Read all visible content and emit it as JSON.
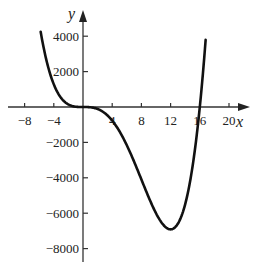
{
  "chart_data": {
    "type": "line",
    "title": "",
    "xlabel": "x",
    "ylabel": "y",
    "xlim": [
      -10,
      22
    ],
    "ylim": [
      -8600,
      4300
    ],
    "x_ticks": [
      -8,
      -4,
      4,
      8,
      12,
      16,
      20
    ],
    "x_tick_labels": [
      "−8",
      "−4",
      "4",
      "8",
      "12",
      "16",
      "20"
    ],
    "y_ticks": [
      4000,
      2000,
      -2000,
      -4000,
      -6000,
      -8000
    ],
    "y_tick_labels": [
      "4000",
      "2000",
      "−2000",
      "−4000",
      "−6000",
      "−8000"
    ],
    "grid": false,
    "legend": "none",
    "series": [
      {
        "name": "y = x^4 - 16x^3",
        "x": [
          -5.8,
          -5,
          -4,
          -3,
          -2,
          -1,
          0,
          2,
          4,
          6,
          8,
          10,
          11,
          12,
          13,
          14,
          15,
          16,
          16.8
        ],
        "values": [
          4253,
          2625,
          1280,
          513,
          144,
          17,
          0,
          -112,
          -768,
          -2160,
          -4096,
          -6000,
          -6655,
          -6912,
          -6591,
          -5488,
          -3375,
          0,
          4009
        ]
      }
    ],
    "color": "#111111"
  }
}
